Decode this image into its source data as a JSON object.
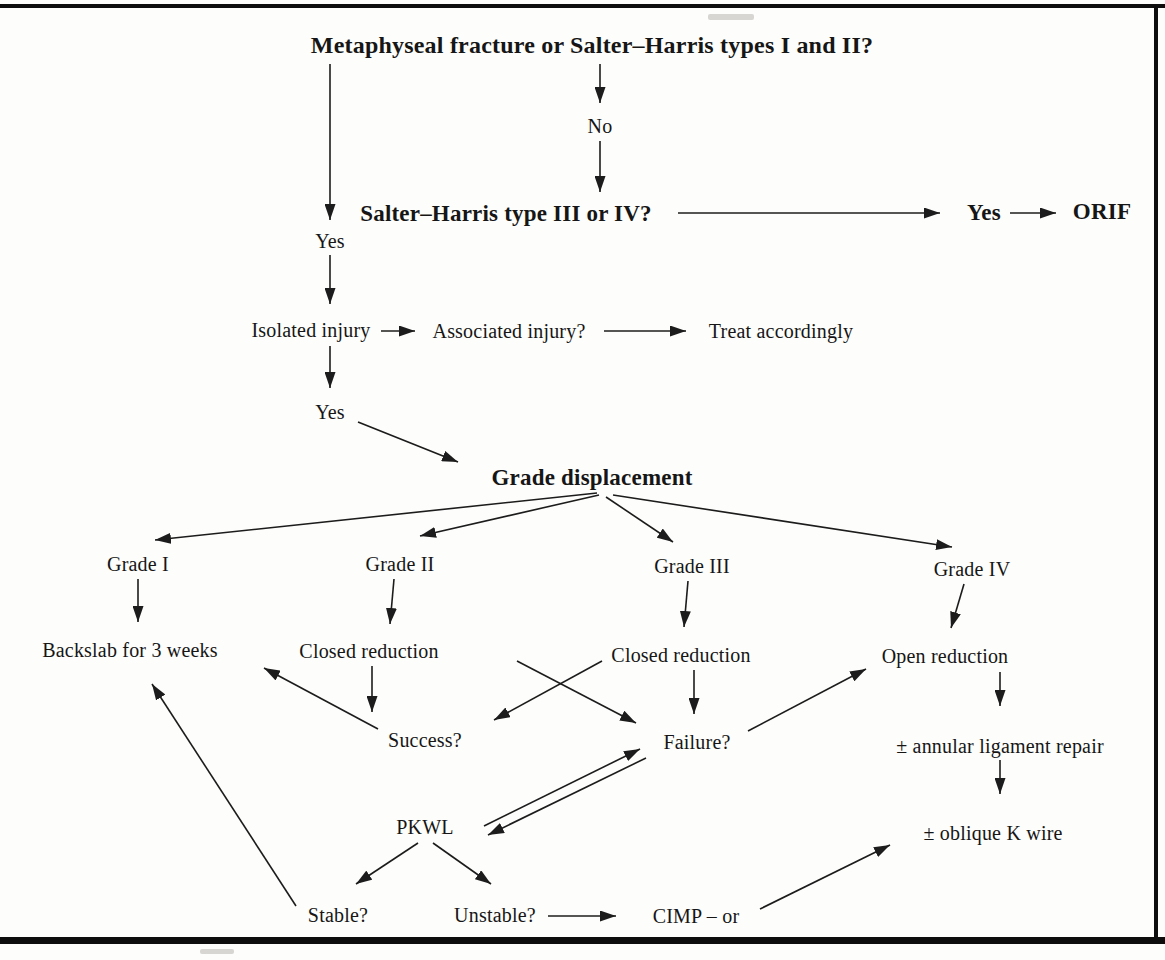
{
  "figure": {
    "type": "clinical-decision-flowchart",
    "topic": "Management of metaphyseal / Salter–Harris fractures"
  },
  "colors": {
    "ink": "#161616",
    "line": "#1c1c1c",
    "background": "#fdfdfb",
    "frame": "#0d0d0d"
  },
  "nodes": {
    "title": {
      "label": "Metaphyseal fracture or Salter–Harris types I and II?"
    },
    "no1": {
      "label": "No"
    },
    "sh34": {
      "label": "Salter–Harris type III or IV?"
    },
    "yes_sh": {
      "label": "Yes"
    },
    "orif": {
      "label": "ORIF"
    },
    "yes1": {
      "label": "Yes"
    },
    "isolated": {
      "label": "Isolated injury"
    },
    "associated": {
      "label": "Associated injury?"
    },
    "treat": {
      "label": "Treat accordingly"
    },
    "yes2": {
      "label": "Yes"
    },
    "grade_disp": {
      "label": "Grade displacement"
    },
    "grade1": {
      "label": "Grade I"
    },
    "grade2": {
      "label": "Grade II"
    },
    "grade3": {
      "label": "Grade III"
    },
    "grade4": {
      "label": "Grade IV"
    },
    "backslab": {
      "label": "Backslab for 3 weeks"
    },
    "closed1": {
      "label": "Closed reduction"
    },
    "closed2": {
      "label": "Closed reduction"
    },
    "open_red": {
      "label": "Open reduction"
    },
    "success": {
      "label": "Success?"
    },
    "failure": {
      "label": "Failure?"
    },
    "annular": {
      "label": "± annular ligament repair"
    },
    "oblique": {
      "label": "± oblique K wire"
    },
    "pkwl": {
      "label": "PKWL"
    },
    "stable": {
      "label": "Stable?"
    },
    "unstable": {
      "label": "Unstable?"
    },
    "cimp": {
      "label": "CIMP – or"
    }
  },
  "edges": [
    {
      "from": "title",
      "to": "no1"
    },
    {
      "from": "no1",
      "to": "sh34"
    },
    {
      "from": "sh34",
      "to": "yes_sh"
    },
    {
      "from": "yes_sh",
      "to": "orif"
    },
    {
      "from": "title",
      "to": "yes1"
    },
    {
      "from": "yes1",
      "to": "isolated"
    },
    {
      "from": "isolated",
      "to": "associated"
    },
    {
      "from": "associated",
      "to": "treat"
    },
    {
      "from": "isolated",
      "to": "yes2"
    },
    {
      "from": "yes2",
      "to": "grade_disp"
    },
    {
      "from": "grade_disp",
      "to": "grade1"
    },
    {
      "from": "grade_disp",
      "to": "grade2"
    },
    {
      "from": "grade_disp",
      "to": "grade3"
    },
    {
      "from": "grade_disp",
      "to": "grade4"
    },
    {
      "from": "grade1",
      "to": "backslab"
    },
    {
      "from": "grade2",
      "to": "closed1"
    },
    {
      "from": "grade3",
      "to": "closed2"
    },
    {
      "from": "grade4",
      "to": "open_red"
    },
    {
      "from": "closed1",
      "to": "success"
    },
    {
      "from": "closed1",
      "to": "failure"
    },
    {
      "from": "closed2",
      "to": "success"
    },
    {
      "from": "closed2",
      "to": "failure"
    },
    {
      "from": "success",
      "to": "backslab"
    },
    {
      "from": "failure",
      "to": "open_red"
    },
    {
      "from": "open_red",
      "to": "annular"
    },
    {
      "from": "annular",
      "to": "oblique"
    },
    {
      "from": "pkwl",
      "to": "failure",
      "style": "double-line"
    },
    {
      "from": "failure",
      "to": "pkwl",
      "style": "double-line"
    },
    {
      "from": "pkwl",
      "to": "stable"
    },
    {
      "from": "pkwl",
      "to": "unstable"
    },
    {
      "from": "unstable",
      "to": "cimp"
    },
    {
      "from": "cimp",
      "to": "oblique"
    },
    {
      "from": "stable",
      "to": "backslab"
    }
  ]
}
